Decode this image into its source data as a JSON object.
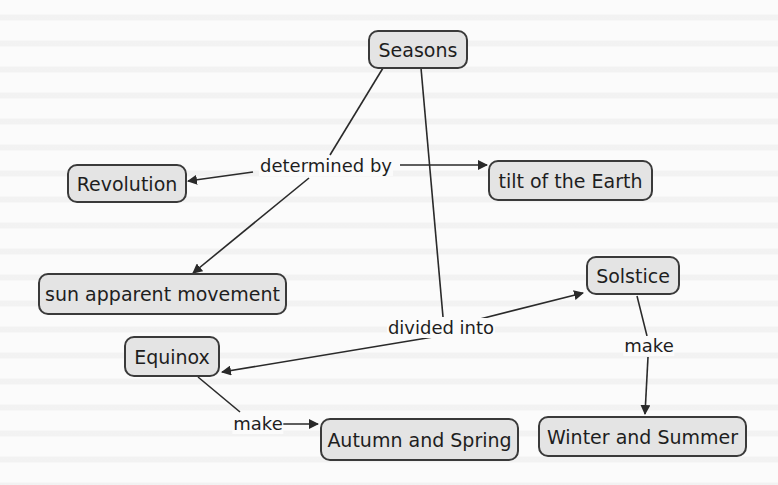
{
  "diagram": {
    "type": "concept-map",
    "colors": {
      "node_fill": "#e4e4e4",
      "node_border": "#3a3a3a",
      "line": "#2a2a2a",
      "text": "#1e1e1e",
      "background": "#fbfbfb"
    },
    "nodes": {
      "seasons": "Seasons",
      "revolution": "Revolution",
      "tilt": "tilt of the Earth",
      "sun_movement": "sun apparent movement",
      "equinox": "Equinox",
      "solstice": "Solstice",
      "autumn_spring": "Autumn and Spring",
      "winter_summer": "Winter and Summer"
    },
    "link_labels": {
      "determined_by": "determined by",
      "divided_into": "divided into",
      "make_equinox": "make",
      "make_solstice": "make"
    },
    "relations": [
      {
        "from": "Seasons",
        "label": "determined by",
        "to": [
          "Revolution",
          "tilt of the Earth",
          "sun apparent movement"
        ]
      },
      {
        "from": "Seasons",
        "label": "divided into",
        "to": [
          "Equinox",
          "Solstice"
        ]
      },
      {
        "from": "Equinox",
        "label": "make",
        "to": [
          "Autumn and Spring"
        ]
      },
      {
        "from": "Solstice",
        "label": "make",
        "to": [
          "Winter and Summer"
        ]
      }
    ]
  }
}
